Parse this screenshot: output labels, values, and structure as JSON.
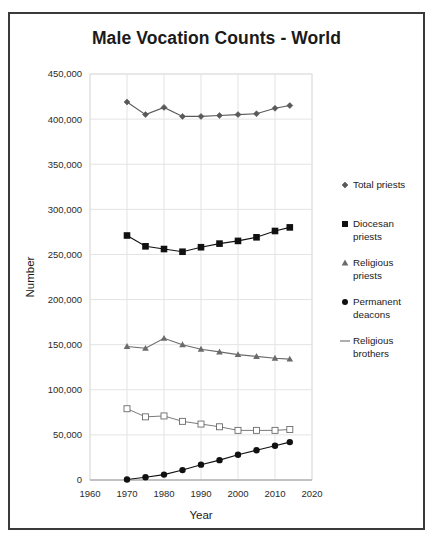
{
  "chart_data": {
    "type": "line",
    "title": "Male Vocation Counts - World",
    "xlabel": "Year",
    "ylabel": "Number",
    "xlim": [
      1960,
      2020
    ],
    "ylim": [
      0,
      450000
    ],
    "xticks": [
      1960,
      1970,
      1980,
      1990,
      2000,
      2010,
      2020
    ],
    "yticks": [
      0,
      50000,
      100000,
      150000,
      200000,
      250000,
      300000,
      350000,
      400000,
      450000
    ],
    "xtick_labels": [
      "1960",
      "1970",
      "1980",
      "1990",
      "2000",
      "2010",
      "2020"
    ],
    "ytick_labels": [
      "0",
      "50,000",
      "100,000",
      "150,000",
      "200,000",
      "250,000",
      "300,000",
      "350,000",
      "400,000",
      "450,000"
    ],
    "grid": true,
    "legend_position": "right",
    "x": [
      1970,
      1975,
      1980,
      1985,
      1990,
      1995,
      2000,
      2005,
      2010,
      2014
    ],
    "series": [
      {
        "name": "Total priests",
        "marker": "diamond",
        "color": "#595959",
        "values": [
          419000,
          405000,
          413000,
          403000,
          403000,
          404000,
          405000,
          406000,
          412000,
          415000
        ]
      },
      {
        "name": "Diocesan priests",
        "marker": "square-filled",
        "color": "#111111",
        "values": [
          271000,
          259000,
          256000,
          253000,
          258000,
          262000,
          265000,
          269000,
          276000,
          280000
        ]
      },
      {
        "name": "Religious priests",
        "marker": "triangle",
        "color": "#6b6b6b",
        "values": [
          148000,
          146000,
          157000,
          150000,
          145000,
          142000,
          139000,
          137000,
          135000,
          134000
        ]
      },
      {
        "name": "Permanent deacons",
        "marker": "circle-filled",
        "color": "#111111",
        "values": [
          600,
          3000,
          6000,
          11000,
          17000,
          22000,
          28000,
          33000,
          38000,
          42000
        ]
      },
      {
        "name": "Religious brothers",
        "marker": "square-open",
        "color": "#6b6b6b",
        "values": [
          79000,
          70000,
          71000,
          65000,
          62000,
          59000,
          55000,
          55000,
          55000,
          56000
        ]
      }
    ]
  }
}
